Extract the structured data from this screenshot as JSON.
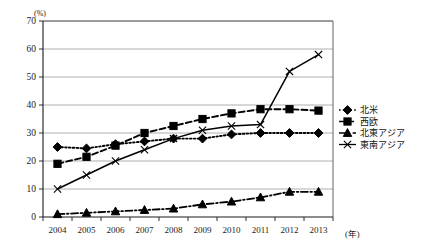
{
  "chart_data": {
    "type": "line",
    "title": "",
    "xlabel": "(年)",
    "ylabel": "(%)",
    "categories": [
      "2004",
      "2005",
      "2006",
      "2007",
      "2008",
      "2009",
      "2010",
      "2011",
      "2012",
      "2013"
    ],
    "ylim": [
      0,
      70
    ],
    "ytick_values": [
      "0",
      "10",
      "20",
      "30",
      "40",
      "50",
      "60",
      "70"
    ],
    "grid": true,
    "legend_position": "right",
    "series": [
      {
        "name": "北米",
        "marker": "diamond",
        "dash": "dotted",
        "values": [
          25,
          24.5,
          26,
          27,
          28,
          28,
          29.5,
          30,
          30,
          30
        ]
      },
      {
        "name": "西欧",
        "marker": "square",
        "dash": "dashed",
        "values": [
          19,
          21.5,
          25.5,
          30,
          32.5,
          35,
          37,
          38.5,
          38.5,
          38
        ]
      },
      {
        "name": "北東アジア",
        "marker": "triangle",
        "dash": "dash-dot",
        "values": [
          1,
          1.5,
          2,
          2.5,
          3,
          4.5,
          5.5,
          7,
          9,
          9
        ]
      },
      {
        "name": "東南アジア",
        "marker": "cross",
        "dash": "solid",
        "values": [
          10,
          15,
          20,
          24,
          28,
          31,
          32.5,
          33,
          52,
          58
        ]
      }
    ]
  }
}
